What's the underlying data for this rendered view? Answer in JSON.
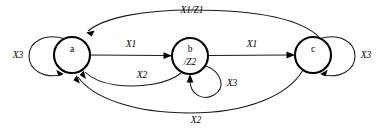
{
  "diagram": {
    "kind": "state-transition-diagram",
    "background_color": "#ffffff",
    "line_color": "#1a1a1a",
    "state_stroke_color": "#000000",
    "states": [
      {
        "id": "a",
        "label": "a",
        "output": "",
        "cx": 72,
        "cy": 55,
        "r": 18
      },
      {
        "id": "b",
        "label": "b",
        "output": "/Z2",
        "cx": 190,
        "cy": 56,
        "r": 18
      },
      {
        "id": "c",
        "label": "c",
        "output": "",
        "cx": 313,
        "cy": 55,
        "r": 18
      }
    ],
    "transitions": [
      {
        "id": "a-self",
        "from": "a",
        "to": "a",
        "label": "X3",
        "label_x": 18,
        "label_y": 56,
        "kind": "self-loop-left"
      },
      {
        "id": "a-to-b",
        "from": "a",
        "to": "b",
        "label": "X1",
        "label_x": 131,
        "label_y": 45,
        "kind": "straight"
      },
      {
        "id": "b-to-a",
        "from": "b",
        "to": "a",
        "label": "X2",
        "label_x": 142,
        "label_y": 76,
        "kind": "arc-below-short"
      },
      {
        "id": "b-self",
        "from": "b",
        "to": "b",
        "label": "X3",
        "label_x": 232,
        "label_y": 84,
        "kind": "self-loop-below-right"
      },
      {
        "id": "b-to-c",
        "from": "b",
        "to": "c",
        "label": "X1",
        "label_x": 252,
        "label_y": 45,
        "kind": "straight"
      },
      {
        "id": "c-self",
        "from": "c",
        "to": "c",
        "label": "X3",
        "label_x": 366,
        "label_y": 56,
        "kind": "self-loop-right"
      },
      {
        "id": "c-to-a-top",
        "from": "c",
        "to": "a",
        "label": "X1/Z1",
        "label_x": 192,
        "label_y": 11,
        "kind": "arc-above-long"
      },
      {
        "id": "c-to-a-bottom",
        "from": "c",
        "to": "a",
        "label": "X2",
        "label_x": 196,
        "label_y": 121,
        "kind": "arc-below-long"
      }
    ]
  }
}
